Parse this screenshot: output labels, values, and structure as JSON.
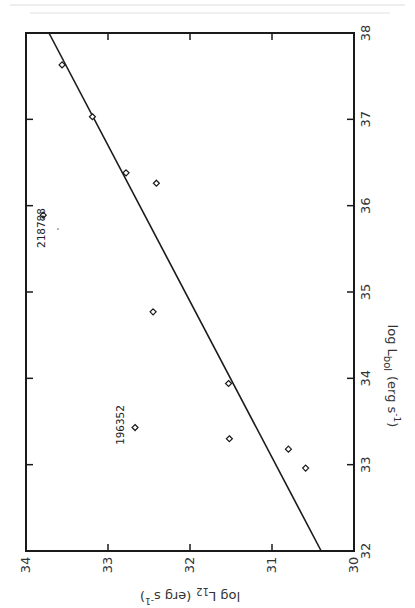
{
  "chart_data": {
    "type": "scatter",
    "orientation_note": "figure printed rotated 90 degrees",
    "xlabel": "log L_bol (erg s^-1)",
    "ylabel": "log L_12 (erg s^-1)",
    "x_axis": {
      "label_main": "log L",
      "label_sub": "bol",
      "label_unit": "(erg s",
      "label_exp": "-1",
      "label_close": ")",
      "range": [
        32,
        38
      ],
      "ticks": [
        "32",
        "33",
        "34",
        "35",
        "36",
        "37",
        "38"
      ]
    },
    "y_axis": {
      "label_main": "log L",
      "label_sub": "12",
      "label_unit": "(erg s",
      "label_exp": "-1",
      "label_close": ")",
      "range": [
        30,
        34
      ],
      "ticks": [
        "30",
        "31",
        "32",
        "33",
        "34"
      ]
    },
    "xlim": [
      32,
      38
    ],
    "ylim": [
      30,
      34
    ],
    "grid": false,
    "series": [
      {
        "name": "stars",
        "marker": "open-diamond",
        "points": [
          {
            "x": 37.63,
            "y": 33.56
          },
          {
            "x": 37.03,
            "y": 33.19
          },
          {
            "x": 36.38,
            "y": 32.78
          },
          {
            "x": 36.26,
            "y": 32.41
          },
          {
            "x": 35.89,
            "y": 33.79,
            "label": "218788"
          },
          {
            "x": 34.77,
            "y": 32.45
          },
          {
            "x": 33.94,
            "y": 31.53
          },
          {
            "x": 33.43,
            "y": 32.67,
            "label": "196352"
          },
          {
            "x": 33.3,
            "y": 31.52
          },
          {
            "x": 33.18,
            "y": 30.8
          },
          {
            "x": 32.96,
            "y": 30.59
          }
        ]
      },
      {
        "name": "linear fit",
        "type": "line",
        "points": [
          {
            "x": 32.0,
            "y": 30.4
          },
          {
            "x": 38.0,
            "y": 33.72
          }
        ]
      }
    ],
    "annotations": [
      "218788",
      "196352"
    ]
  }
}
